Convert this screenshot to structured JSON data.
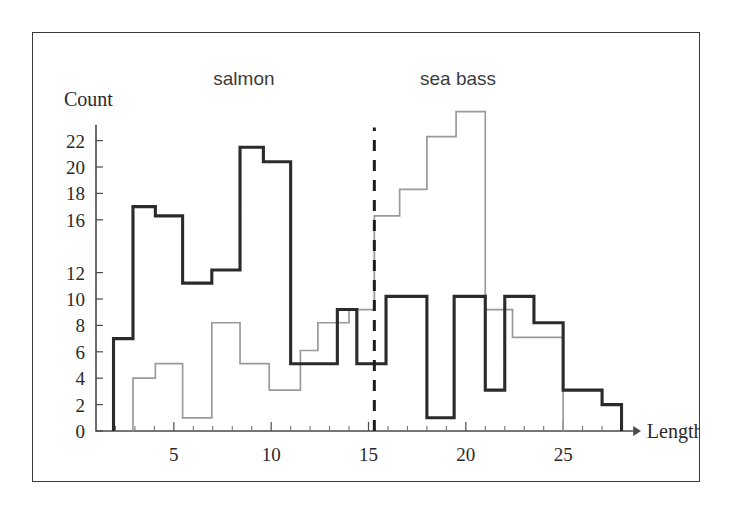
{
  "figure": {
    "background_color": "#ffffff",
    "frame_color": "#3a3a3a"
  },
  "labels": {
    "count_axis_title": "Count",
    "length_axis_title": "Length",
    "salmon_label": "salmon",
    "sea_bass_label": "sea bass"
  },
  "chart_data": {
    "type": "line",
    "title": "",
    "subtitle": "",
    "xlabel": "Length",
    "ylabel": "Count",
    "xlim": [
      1,
      29
    ],
    "ylim": [
      0,
      25
    ],
    "grid": false,
    "legend_position": "in-plot-top-annotations",
    "x_ticks_major": [
      5,
      10,
      15,
      20,
      25
    ],
    "x_tick_labels": [
      "5",
      "10",
      "15",
      "20",
      "25"
    ],
    "x_ticks_minor": [
      2,
      3,
      4,
      6,
      7,
      8,
      9,
      11,
      12,
      13,
      14,
      16,
      17,
      18,
      19,
      21,
      22,
      23,
      24,
      26,
      27,
      28
    ],
    "y_ticks": [
      0,
      2,
      4,
      6,
      8,
      10,
      12,
      16,
      18,
      20,
      22
    ],
    "y_tick_labels": [
      "0",
      "2",
      "4",
      "6",
      "8",
      "10",
      "12",
      "16",
      "18",
      "20",
      "22"
    ],
    "annotations": [
      {
        "name": "decision-boundary",
        "kind": "vertical-dashed-line",
        "x": 15.3,
        "y_from": 0,
        "y_to": 23.0,
        "color": "#1d1d1d"
      },
      {
        "name": "salmon-region-label",
        "kind": "text",
        "text": "salmon",
        "x": 8.6,
        "y": 26.2
      },
      {
        "name": "sea-bass-region-label",
        "kind": "text",
        "text": "sea bass",
        "x": 19.6,
        "y": 26.2
      }
    ],
    "series": [
      {
        "name": "salmon",
        "color": "#2b2b2b",
        "style": "bold-step",
        "step_edges": [
          1.9,
          2.9,
          4.05,
          5.45,
          6.95,
          8.4,
          9.6,
          11.0,
          12.4,
          13.4,
          14.4,
          15.9,
          18.0,
          19.4,
          21.0,
          22.0,
          23.5,
          25.0,
          27.0,
          28.0
        ],
        "values": [
          7,
          17,
          16.3,
          11.2,
          12.2,
          21.5,
          20.4,
          5.1,
          5.1,
          9.2,
          5.1,
          10.2,
          1.0,
          10.2,
          3.1,
          10.2,
          8.2,
          3.1,
          2.0
        ]
      },
      {
        "name": "sea bass",
        "color": "#9a9a9a",
        "style": "thin-step",
        "step_edges": [
          2.9,
          4.05,
          5.45,
          6.95,
          8.4,
          9.9,
          11.5,
          12.4,
          14.0,
          15.3,
          16.6,
          18.0,
          19.5,
          21.0,
          22.4,
          25.0
        ],
        "values": [
          4.0,
          5.1,
          1.0,
          8.2,
          5.1,
          3.1,
          6.1,
          8.2,
          9.2,
          16.3,
          18.3,
          22.3,
          24.2,
          9.2,
          7.1
        ]
      }
    ]
  }
}
